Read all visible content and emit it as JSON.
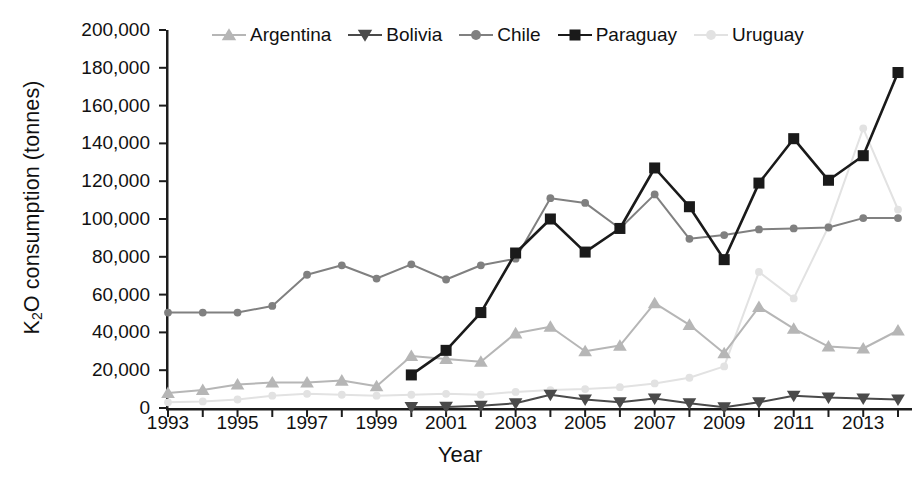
{
  "chart_data": {
    "type": "line",
    "title": "",
    "xlabel": "Year",
    "ylabel": "K2O consumption (tonnes)",
    "ylabel_html": "K<sub>2</sub>O consumption (tonnes)",
    "xlim": [
      1993,
      2014
    ],
    "ylim": [
      0,
      200000
    ],
    "ytick_step": 20000,
    "ytick_labels": [
      "200,000",
      "180,000",
      "160,000",
      "140,000",
      "120,000",
      "100,000",
      "80,000",
      "60,000",
      "40,000",
      "20,000",
      "0"
    ],
    "ytick_values": [
      200000,
      180000,
      160000,
      140000,
      120000,
      100000,
      80000,
      60000,
      40000,
      20000,
      0
    ],
    "xtick_labels": [
      "1993",
      "1995",
      "1997",
      "1999",
      "2001",
      "2003",
      "2005",
      "2007",
      "2009",
      "2011",
      "2013"
    ],
    "xtick_values": [
      1993,
      1995,
      1997,
      1999,
      2001,
      2003,
      2005,
      2007,
      2009,
      2011,
      2013
    ],
    "x": [
      1993,
      1994,
      1995,
      1996,
      1997,
      1998,
      1999,
      2000,
      2001,
      2002,
      2003,
      2004,
      2005,
      2006,
      2007,
      2008,
      2009,
      2010,
      2011,
      2012,
      2013,
      2014
    ],
    "grid": false,
    "legend_position": "top",
    "series": [
      {
        "name": "Argentina",
        "color": "#b6b6b6",
        "marker": "triangle-up",
        "values": [
          8000,
          9500,
          12500,
          13500,
          13500,
          14500,
          11500,
          27500,
          26000,
          24500,
          39500,
          43000,
          30000,
          33000,
          55500,
          44000,
          29000,
          53500,
          42000,
          32500,
          31500,
          41000
        ]
      },
      {
        "name": "Bolivia",
        "color": "#4a4a4a",
        "marker": "triangle-down",
        "values": [
          null,
          null,
          null,
          null,
          null,
          null,
          null,
          500,
          600,
          1200,
          2500,
          7000,
          4500,
          3000,
          5000,
          2500,
          400,
          3000,
          6500,
          5500,
          5000,
          4500
        ]
      },
      {
        "name": "Chile",
        "color": "#808080",
        "marker": "circle",
        "values": [
          50500,
          50500,
          50500,
          54000,
          70500,
          75500,
          68500,
          76000,
          68000,
          75500,
          79000,
          111000,
          108500,
          95000,
          113000,
          89500,
          91500,
          94500,
          95000,
          95500,
          100500,
          100500
        ]
      },
      {
        "name": "Paraguay",
        "color": "#1a1a1a",
        "marker": "square",
        "values": [
          null,
          null,
          null,
          null,
          null,
          null,
          null,
          17500,
          30500,
          50500,
          82000,
          100000,
          82500,
          95000,
          127000,
          106500,
          78500,
          119000,
          142500,
          120500,
          133500,
          177500
        ]
      },
      {
        "name": "Uruguay",
        "color": "#e2e2e2",
        "marker": "circle",
        "values": [
          3000,
          3500,
          4500,
          6500,
          7500,
          7000,
          6500,
          7000,
          7500,
          7000,
          8500,
          9500,
          10000,
          11000,
          13000,
          16000,
          22000,
          72000,
          58000,
          96000,
          148000,
          105000
        ]
      }
    ]
  },
  "axis": {
    "x_title": "Year"
  },
  "legend": {
    "items": [
      {
        "label": "Argentina"
      },
      {
        "label": "Bolivia"
      },
      {
        "label": "Chile"
      },
      {
        "label": "Paraguay"
      },
      {
        "label": "Uruguay"
      }
    ]
  }
}
